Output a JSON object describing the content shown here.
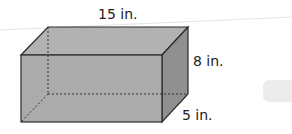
{
  "figure": {
    "shape": "rectangular prism",
    "labels": {
      "length": "15 in.",
      "height": "8 in.",
      "width": "5 in."
    },
    "colors": {
      "front_face": "#a8a8a8",
      "top_face": "#b4b4b4",
      "side_face": "#8f8f8f",
      "edge": "#2a2a2a",
      "hidden_edge": "#333333"
    }
  }
}
